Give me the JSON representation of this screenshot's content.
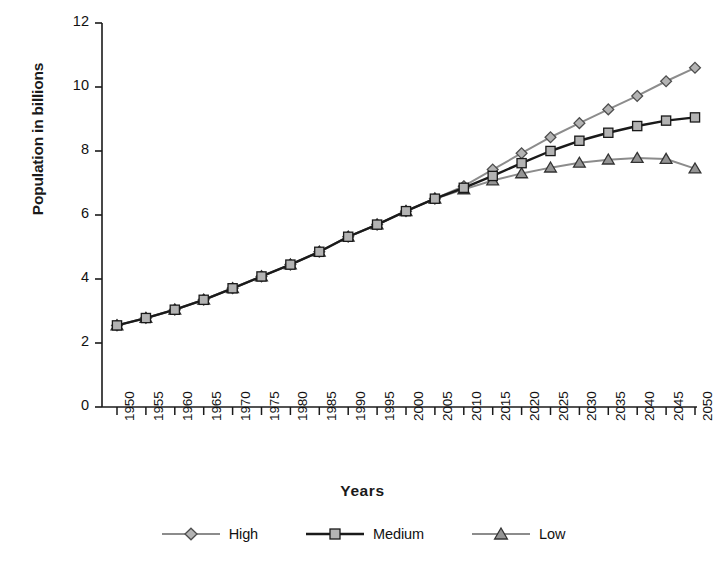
{
  "chart_data": {
    "type": "line",
    "title": "",
    "xlabel": "Years",
    "ylabel": "Population in billions",
    "xlim": [
      1950,
      2050
    ],
    "ylim": [
      0,
      12
    ],
    "ytick_step": 2,
    "xtick_step": 5,
    "grid": false,
    "legend_position": "bottom",
    "x": [
      1950,
      1955,
      1960,
      1965,
      1970,
      1975,
      1980,
      1985,
      1990,
      1995,
      2000,
      2005,
      2010,
      2015,
      2020,
      2025,
      2030,
      2035,
      2040,
      2045,
      2050
    ],
    "xtick_labels": [
      "1950",
      "1955",
      "1960",
      "1965",
      "1970",
      "1975",
      "1980",
      "1985",
      "1990",
      "1995",
      "2000",
      "2005",
      "2010",
      "2015",
      "2020",
      "2025",
      "2030",
      "2035",
      "2040",
      "2045",
      "2050"
    ],
    "ytick_labels": [
      "0",
      "2",
      "4",
      "6",
      "8",
      "10",
      "12"
    ],
    "ytick_values": [
      0,
      2,
      4,
      6,
      8,
      10,
      12
    ],
    "series": [
      {
        "name": "High",
        "marker": "diamond",
        "color": "#8c8c8c",
        "marker_fill": "#b3b3b3",
        "marker_stroke": "#4d4d4d",
        "values": [
          2.55,
          2.78,
          3.04,
          3.35,
          3.71,
          4.08,
          4.45,
          4.85,
          5.32,
          5.7,
          6.12,
          6.51,
          6.9,
          7.42,
          7.93,
          8.43,
          8.87,
          9.3,
          9.72,
          10.18,
          10.6
        ]
      },
      {
        "name": "Medium",
        "marker": "square",
        "color": "#1a1a1a",
        "marker_fill": "#b3b3b3",
        "marker_stroke": "#1a1a1a",
        "values": [
          2.55,
          2.78,
          3.04,
          3.35,
          3.71,
          4.08,
          4.45,
          4.85,
          5.32,
          5.7,
          6.12,
          6.51,
          6.85,
          7.22,
          7.62,
          8.0,
          8.32,
          8.57,
          8.78,
          8.95,
          9.05
        ]
      },
      {
        "name": "Low",
        "marker": "triangle",
        "color": "#8c8c8c",
        "marker_fill": "#949494",
        "marker_stroke": "#333333",
        "values": [
          2.55,
          2.78,
          3.04,
          3.35,
          3.71,
          4.08,
          4.45,
          4.85,
          5.32,
          5.7,
          6.12,
          6.51,
          6.8,
          7.08,
          7.3,
          7.48,
          7.63,
          7.73,
          7.78,
          7.75,
          7.45
        ]
      }
    ]
  },
  "legend": {
    "items": [
      {
        "label": "High"
      },
      {
        "label": "Medium"
      },
      {
        "label": "Low"
      }
    ]
  },
  "axes": {
    "y_title": "Population in billions",
    "x_title": "Years"
  }
}
